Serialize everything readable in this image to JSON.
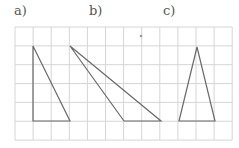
{
  "labels": {
    "a": "a)",
    "b": "b)",
    "c": "c)"
  },
  "grid": {
    "x0": 15,
    "y0": 27,
    "cols": 12,
    "rows": 6,
    "cell_w": 18.1,
    "cell_h": 18.85,
    "line_color": "#d6d6d6"
  },
  "stroke_color": "#6a6a6a",
  "triangles": [
    {
      "id": "a",
      "points": [
        [
          33,
          46
        ],
        [
          33,
          121
        ],
        [
          70,
          121
        ]
      ]
    },
    {
      "id": "b",
      "points": [
        [
          70,
          46
        ],
        [
          124,
          121
        ],
        [
          161,
          121
        ]
      ]
    },
    {
      "id": "c",
      "points": [
        [
          197,
          47
        ],
        [
          179,
          121
        ],
        [
          215,
          121
        ]
      ]
    }
  ],
  "dot": {
    "x": 141,
    "y": 36
  }
}
